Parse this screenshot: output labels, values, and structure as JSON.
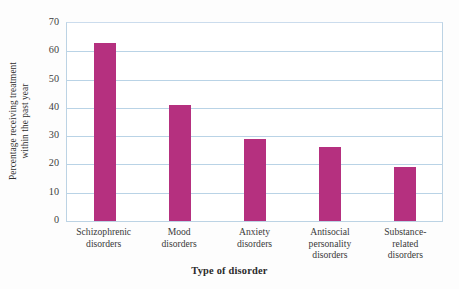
{
  "chart_data": {
    "type": "bar",
    "title": "",
    "xlabel": "Type of disorder",
    "ylabel": "Percentage receiving treatment within the past year",
    "ylabel_lines": [
      "Percentage receiving treatment",
      "within the past year"
    ],
    "categories": [
      "Schizophrenic disorders",
      "Mood disorders",
      "Anxiety disorders",
      "Antisocial personality disorders",
      "Substance-related disorders"
    ],
    "category_lines": [
      [
        "Schizophrenic",
        "disorders"
      ],
      [
        "Mood",
        "disorders"
      ],
      [
        "Anxiety",
        "disorders"
      ],
      [
        "Antisocial",
        "personality",
        "disorders"
      ],
      [
        "Substance-",
        "related",
        "disorders"
      ]
    ],
    "values": [
      63,
      41,
      29,
      26,
      19
    ],
    "ylim": [
      0,
      70
    ],
    "yticks": [
      0,
      10,
      20,
      30,
      40,
      50,
      60,
      70
    ],
    "grid": true,
    "legend": "none",
    "colors": {
      "bar": "#b5307f",
      "gridline": "#b9d3e6",
      "axis_border": "#bcd3e4",
      "background": "#ffffff",
      "text": "#3a3a3a"
    }
  }
}
